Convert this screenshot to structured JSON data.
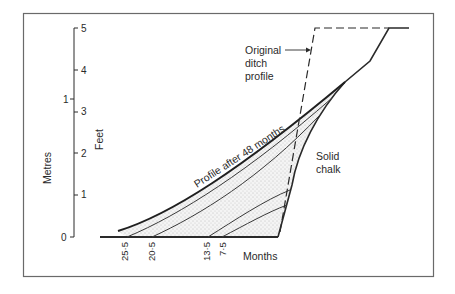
{
  "figure": {
    "frame_color": "#6a6a6a",
    "line_color": "#2a2a2a",
    "stipple_color": "#9a9a9a"
  },
  "axes": {
    "feet": {
      "title": "Feet",
      "ticks": [
        "0",
        "1",
        "2",
        "3",
        "4",
        "5"
      ]
    },
    "metres": {
      "title": "Metres",
      "ticks": [
        "0",
        "1"
      ]
    },
    "x": {
      "title": "Months",
      "ticks": [
        "25·5",
        "20·5",
        "13·5",
        "7·5"
      ]
    }
  },
  "annotations": {
    "original_profile": [
      "Original",
      "ditch",
      "profile"
    ],
    "profile_48": "Profile after 48 months",
    "solid_chalk": [
      "Solid",
      "chalk"
    ]
  }
}
